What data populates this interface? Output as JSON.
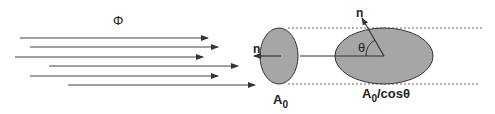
{
  "diagram": {
    "flux_label": "Φ",
    "normal_label_small": "n",
    "normal_label_large": "n",
    "angle_label": "θ",
    "area_small_label": "A",
    "area_small_sub": "0",
    "area_large_label": "A",
    "area_large_sub": "0",
    "area_large_suffix": "/cosθ",
    "colors": {
      "line": "#333333",
      "fill": "#a6a6a6",
      "dash": "#555555"
    },
    "arrows": [
      {
        "y": 38,
        "x1": 20,
        "x2": 208
      },
      {
        "y": 47,
        "x1": 30,
        "x2": 218
      },
      {
        "y": 57,
        "x1": 15,
        "x2": 203
      },
      {
        "y": 66,
        "x1": 49,
        "x2": 238
      },
      {
        "y": 76,
        "x1": 30,
        "x2": 218
      },
      {
        "y": 85,
        "x1": 68,
        "x2": 255
      }
    ]
  }
}
